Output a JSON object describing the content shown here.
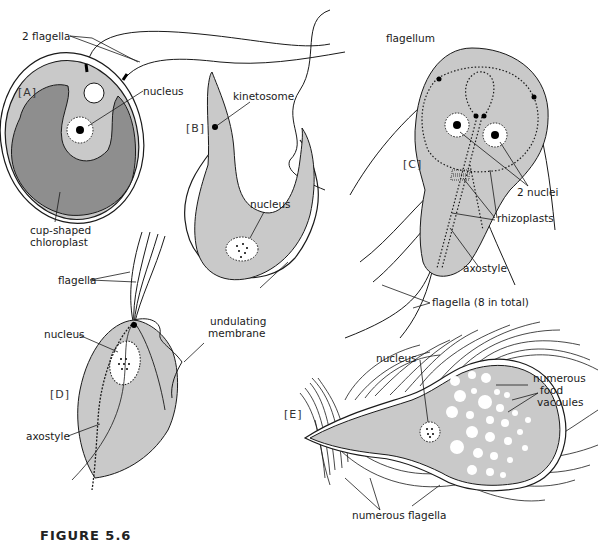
{
  "figure": {
    "caption_visible_fragment": "FIGURE 5.6",
    "colors": {
      "cytoplasm_light": "#c9c9c9",
      "chloroplast_dark": "#8e8e8e",
      "line": "#1a1a1a",
      "background": "#ffffff"
    }
  },
  "panels": {
    "A": {
      "tag": "[A]",
      "labels": {
        "flagella": "2 flagella",
        "nucleus": "nucleus",
        "chloroplast_line1": "cup-shaped",
        "chloroplast_line2": "chloroplast"
      }
    },
    "B": {
      "tag": "[B]",
      "labels": {
        "kinetosome": "kinetosome",
        "nucleus": "nucleus",
        "flagellum": "flagellum"
      }
    },
    "C": {
      "tag": "[C]",
      "labels": {
        "nuclei": "2 nuclei",
        "rhizoplasts": "rhizoplasts",
        "axostyle": "axostyle",
        "flagella": "flagella (8 in total)"
      }
    },
    "D": {
      "tag": "[D]",
      "labels": {
        "flagella": "flagella",
        "nucleus": "nucleus",
        "undulating_line1": "undulating",
        "undulating_line2": "membrane",
        "axostyle": "axostyle"
      }
    },
    "E": {
      "tag": "[E]",
      "labels": {
        "nucleus": "nucleus",
        "vacuoles_line1": "numerous",
        "vacuoles_line2": "food",
        "vacuoles_line3": "vacoules",
        "flagella": "numerous flagella"
      }
    }
  }
}
